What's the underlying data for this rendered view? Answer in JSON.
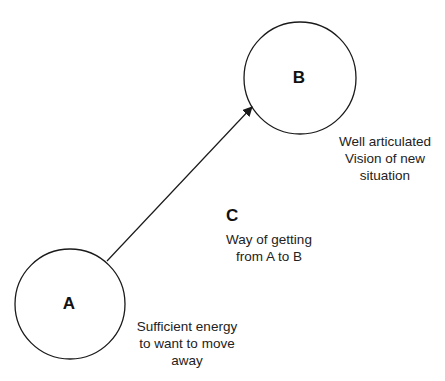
{
  "nodes": {
    "a": {
      "label": "A",
      "caption": [
        "Sufficient energy",
        "to want to move",
        "away"
      ]
    },
    "b": {
      "label": "B",
      "caption": [
        "Well articulated",
        "Vision of new",
        "situation"
      ]
    }
  },
  "transition": {
    "label": "C",
    "caption": [
      "Way of getting",
      "from A to B"
    ]
  },
  "colors": {
    "stroke": "#1a1a1a",
    "background": "#ffffff"
  }
}
